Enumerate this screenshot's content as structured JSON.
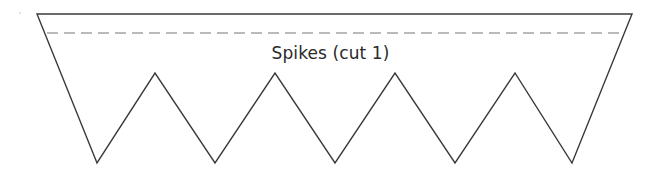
{
  "template": {
    "title": "Spikes (cut 1)",
    "colors": {
      "outline": "#3a3a3a",
      "cut_line": "#777777",
      "background": "#ffffff"
    },
    "shape": {
      "top_left": [
        37,
        14
      ],
      "top_right": [
        632,
        14
      ],
      "dashed_line": {
        "y": 33,
        "x_start": 47,
        "x_end": 623
      },
      "spike_peaks_y": 73,
      "spike_valleys_y": 163,
      "peaks_x": [
        155,
        275,
        395,
        515
      ],
      "valleys_x": [
        97,
        215,
        335,
        455,
        572
      ],
      "spike_count": 5
    }
  }
}
